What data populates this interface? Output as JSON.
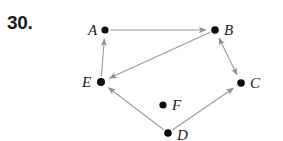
{
  "figure": {
    "problem_number": "30.",
    "background_color": "#ffffff",
    "edge_color": "#9a9a9a",
    "vertex_color": "#0d0d0d",
    "label_color": "#1a1a1a",
    "width": 283,
    "height": 141
  },
  "graph": {
    "vertices": [
      {
        "id": "A",
        "label": "A",
        "x": 105,
        "y": 30,
        "label_x": 88,
        "label_y": 35,
        "radius": 3.6
      },
      {
        "id": "B",
        "label": "B",
        "x": 215,
        "y": 30,
        "label_x": 224,
        "label_y": 35,
        "radius": 3.8
      },
      {
        "id": "C",
        "label": "C",
        "x": 241,
        "y": 83,
        "label_x": 250,
        "label_y": 88,
        "radius": 3.8
      },
      {
        "id": "D",
        "label": "D",
        "x": 168,
        "y": 133,
        "label_x": 177,
        "label_y": 140,
        "radius": 3.8
      },
      {
        "id": "E",
        "label": "E",
        "x": 101,
        "y": 82,
        "label_x": 82,
        "label_y": 87,
        "radius": 4.0
      },
      {
        "id": "F",
        "label": "F",
        "x": 163,
        "y": 105,
        "label_x": 172,
        "label_y": 110,
        "radius": 3.6
      }
    ],
    "edges": [
      {
        "from": "A",
        "to": "B",
        "arrow": "forward"
      },
      {
        "from": "B",
        "to": "E",
        "arrow": "forward"
      },
      {
        "from": "B",
        "to": "C",
        "arrow": "both"
      },
      {
        "from": "E",
        "to": "A",
        "arrow": "forward"
      },
      {
        "from": "D",
        "to": "E",
        "arrow": "forward"
      },
      {
        "from": "D",
        "to": "C",
        "arrow": "forward"
      }
    ],
    "isolated_vertices": [
      "F"
    ]
  }
}
